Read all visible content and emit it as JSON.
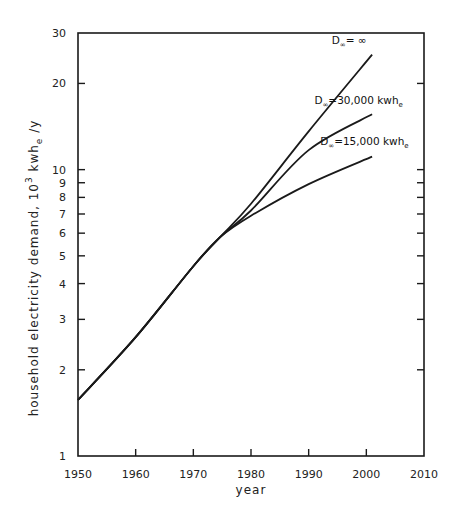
{
  "chart_data": {
    "type": "line",
    "title": "",
    "xlabel": "year",
    "ylabel": "household electricity demand, 10^3 kwh_e/y",
    "ylabel_parts": {
      "main": "household electricity demand, 10",
      "sup": "3",
      "unit": " kwh",
      "sub": "e",
      "tail": " /y"
    },
    "xscale": "linear",
    "yscale": "log",
    "xlim": [
      1950,
      2010
    ],
    "ylim": [
      1,
      30
    ],
    "grid": false,
    "legend": "inline annotations",
    "x_ticks": [
      1950,
      1960,
      1970,
      1980,
      1990,
      2000,
      2010
    ],
    "x_tick_labels": [
      "1950",
      "1960",
      "1970",
      "1980",
      "1990",
      "2000",
      "2010"
    ],
    "y_ticks": [
      1,
      2,
      3,
      4,
      5,
      6,
      7,
      8,
      9,
      10,
      20,
      30
    ],
    "y_tick_labels": [
      "1",
      "2",
      "3",
      "4",
      "5",
      "6",
      "7",
      "8",
      "9",
      "10",
      "20",
      "30"
    ],
    "series": [
      {
        "name": "D∞=∞",
        "label_main": "D",
        "label_sub": "∞",
        "label_rest": "= ∞",
        "x": [
          1950,
          1960,
          1970,
          1974.6,
          1980,
          1990,
          2001
        ],
        "values": [
          1.57,
          2.6,
          4.6,
          5.8,
          7.6,
          13.6,
          25.2
        ]
      },
      {
        "name": "D∞=30,000 kwh_e",
        "label_main": "D",
        "label_sub": "∞",
        "label_rest": "=30,000 kwh",
        "label_unit_sub": "e",
        "x": [
          1950,
          1960,
          1970,
          1974.6,
          1980,
          1990,
          2001
        ],
        "values": [
          1.57,
          2.6,
          4.6,
          5.8,
          7.2,
          11.7,
          15.6
        ]
      },
      {
        "name": "D∞=15,000 kwh_e",
        "label_main": "D",
        "label_sub": "∞",
        "label_rest": "=15,000 kwh",
        "label_unit_sub": "e",
        "x": [
          1950,
          1960,
          1970,
          1974.6,
          1980,
          1990,
          2001
        ],
        "values": [
          1.57,
          2.6,
          4.6,
          5.8,
          6.9,
          8.9,
          11.1
        ]
      }
    ],
    "annotations": [
      {
        "text": "D∞= ∞",
        "x": 1994,
        "y": 27.5
      },
      {
        "text": "D∞=30,000 kwh_e",
        "x": 1991,
        "y": 17.0
      },
      {
        "text": "D∞=15,000 kwh_e",
        "x": 1992,
        "y": 12.2
      }
    ]
  },
  "layout": {
    "plot_left": 78,
    "plot_right": 424,
    "plot_top": 33,
    "plot_bottom": 456,
    "line_color": "#1a1a1a"
  }
}
